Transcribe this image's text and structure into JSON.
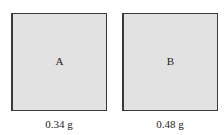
{
  "samples": [
    {
      "label": "A",
      "mass": "0.34 g",
      "fill": "#e2e2e2"
    },
    {
      "label": "B",
      "mass": "0.48 g",
      "fill": "#e2e2e2"
    }
  ]
}
